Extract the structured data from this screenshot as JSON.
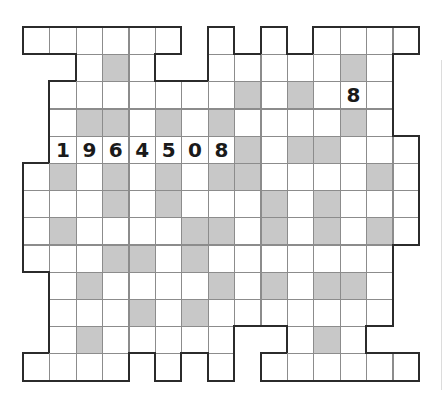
{
  "puzzle": {
    "type": "number-fill-in crossword grid",
    "cols": 15,
    "rows": 13,
    "legend": {
      ".": "no cell",
      "W": "empty white cell",
      "G": "shaded block",
      "digit": "pre-filled digit"
    },
    "colors": {
      "white": "#ffffff",
      "shaded": "#c8c8c8",
      "grid_line": "#8c8c8c",
      "outline": "#2b2b2b",
      "digit": "#1a1a1a"
    },
    "grid": [
      [
        "W",
        "W",
        "W",
        "W",
        "W",
        "W",
        ".",
        "W",
        ".",
        "W",
        ".",
        "W",
        "W",
        "W",
        "W"
      ],
      [
        ".",
        ".",
        "W",
        "G",
        "W",
        ".",
        ".",
        "W",
        "W",
        "W",
        "W",
        "W",
        "G",
        "W",
        "."
      ],
      [
        ".",
        "W",
        "W",
        "W",
        "W",
        "W",
        "W",
        "W",
        "G",
        "W",
        "G",
        "W",
        "8",
        "W",
        "."
      ],
      [
        ".",
        "W",
        "G",
        "G",
        "W",
        "G",
        "W",
        "G",
        "W",
        "W",
        "W",
        "W",
        "G",
        "W",
        "."
      ],
      [
        ".",
        "1",
        "9",
        "6",
        "4",
        "5",
        "0",
        "8",
        "G",
        "W",
        "G",
        "G",
        "W",
        "W",
        "W"
      ],
      [
        "W",
        "G",
        "W",
        "G",
        "W",
        "G",
        "W",
        "G",
        "G",
        "W",
        "W",
        "W",
        "W",
        "G",
        "W"
      ],
      [
        "W",
        "W",
        "W",
        "G",
        "W",
        "G",
        "W",
        "W",
        "W",
        "G",
        "W",
        "G",
        "W",
        "W",
        "W"
      ],
      [
        "W",
        "G",
        "W",
        "W",
        "W",
        "W",
        "G",
        "G",
        "W",
        "G",
        "W",
        "G",
        "W",
        "G",
        "W"
      ],
      [
        "W",
        "W",
        "W",
        "G",
        "G",
        "W",
        "G",
        "W",
        "W",
        "W",
        "W",
        "W",
        "W",
        "W",
        "."
      ],
      [
        ".",
        "W",
        "G",
        "W",
        "W",
        "W",
        "W",
        "G",
        "W",
        "G",
        "W",
        "G",
        "G",
        "W",
        "."
      ],
      [
        ".",
        "W",
        "W",
        "W",
        "G",
        "W",
        "G",
        "W",
        "W",
        "W",
        "W",
        "W",
        "W",
        "W",
        "."
      ],
      [
        ".",
        "W",
        "G",
        "W",
        "W",
        "W",
        "W",
        "W",
        ".",
        ".",
        "W",
        "G",
        "W",
        ".",
        "."
      ],
      [
        "W",
        "W",
        "W",
        "W",
        ".",
        "W",
        ".",
        "W",
        ".",
        "W",
        "W",
        "W",
        "W",
        "W",
        "W"
      ]
    ],
    "given_entries": [
      {
        "label": "horizontal-entry",
        "value": "1964508",
        "row": 4,
        "col_start": 1
      },
      {
        "label": "single-digit",
        "value": "8",
        "row": 2,
        "col": 12
      }
    ]
  }
}
